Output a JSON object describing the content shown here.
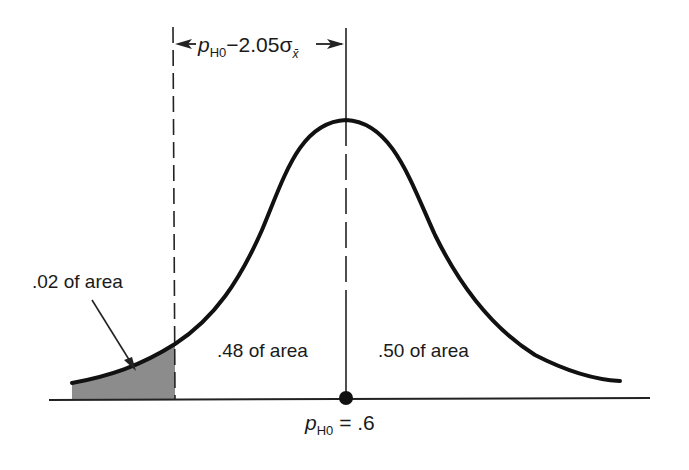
{
  "diagram": {
    "type": "normal-distribution-one-tailed-test",
    "top_bracket": {
      "label_main": "p",
      "label_sub": "H0",
      "label_rest": "−2.05σ",
      "label_sigma_sub": "x̄"
    },
    "regions": [
      {
        "label": ".02 of area",
        "shaded": true
      },
      {
        "label": ".48 of area",
        "shaded": false
      },
      {
        "label": ".50 of area",
        "shaded": false
      }
    ],
    "center_point": {
      "label_main": "p",
      "label_sub": "H0",
      "label_rest": " = .6"
    },
    "colors": {
      "curve": "#111111",
      "shade": "#8c8c8c",
      "axis": "#222222"
    }
  }
}
